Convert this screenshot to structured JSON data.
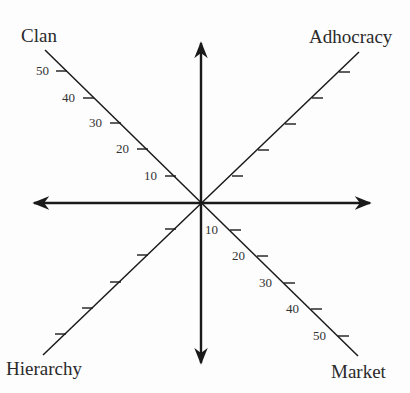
{
  "diagram": {
    "quadrants": {
      "top_left": "Clan",
      "top_right": "Adhocracy",
      "bottom_left": "Hierarchy",
      "bottom_right": "Market"
    },
    "clan_ticks": [
      "50",
      "40",
      "30",
      "20",
      "10"
    ],
    "market_ticks": [
      "10",
      "20",
      "30",
      "40",
      "50"
    ],
    "tick_count_per_diagonal": 5,
    "colors": {
      "line": "#1a1a1a",
      "text": "#2a2a2a",
      "background": "#fdfdfd"
    }
  }
}
